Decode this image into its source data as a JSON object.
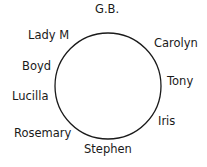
{
  "diagram": {
    "type": "seating-circle",
    "circle": {
      "cx": 108,
      "cy": 86,
      "r": 53,
      "stroke": "#1a1a1a"
    },
    "labels": [
      {
        "text": "G.B.",
        "x": 95,
        "y": 4
      },
      {
        "text": "Carolyn",
        "x": 154,
        "y": 38
      },
      {
        "text": "Tony",
        "x": 167,
        "y": 76
      },
      {
        "text": "Iris",
        "x": 158,
        "y": 116
      },
      {
        "text": "Stephen",
        "x": 84,
        "y": 144
      },
      {
        "text": "Rosemary",
        "x": 14,
        "y": 128
      },
      {
        "text": "Lucilla",
        "x": 12,
        "y": 91
      },
      {
        "text": "Boyd",
        "x": 22,
        "y": 61
      },
      {
        "text": "Lady M",
        "x": 28,
        "y": 30
      }
    ]
  }
}
